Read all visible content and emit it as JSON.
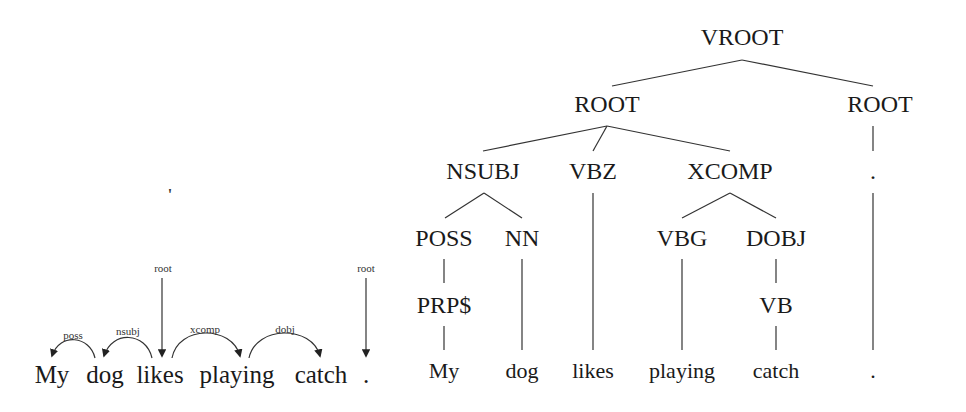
{
  "dependency_diagram": {
    "words": [
      {
        "text": "My",
        "x": 52
      },
      {
        "text": "dog",
        "x": 105
      },
      {
        "text": "likes",
        "x": 160
      },
      {
        "text": "playing",
        "x": 237
      },
      {
        "text": "catch",
        "x": 321
      },
      {
        "text": ".",
        "x": 366
      }
    ],
    "root_labels": [
      {
        "text": "root",
        "x": 163
      },
      {
        "text": "root",
        "x": 366
      }
    ],
    "arcs": [
      {
        "label": "poss",
        "from": "dog",
        "to": "My",
        "label_x": 73
      },
      {
        "label": "nsubj",
        "from": "likes",
        "to": "dog",
        "label_x": 128
      },
      {
        "label": "xcomp",
        "from": "likes",
        "to": "playing",
        "label_x": 205
      },
      {
        "label": "dobj",
        "from": "playing",
        "to": "catch",
        "label_x": 285
      }
    ],
    "stray_mark": "'"
  },
  "constituency_tree": {
    "nodes": {
      "vroot": {
        "label": "VROOT",
        "x": 742,
        "y": 37
      },
      "root1": {
        "label": "ROOT",
        "x": 607,
        "y": 103
      },
      "root2": {
        "label": "ROOT",
        "x": 873,
        "y": 103
      },
      "nsubj": {
        "label": "NSUBJ",
        "x": 483,
        "y": 170
      },
      "vbz": {
        "label": "VBZ",
        "x": 593,
        "y": 170
      },
      "xcomp": {
        "label": "XCOMP",
        "x": 730,
        "y": 170
      },
      "punct": {
        "label": ".",
        "x": 873,
        "y": 170
      },
      "poss": {
        "label": "POSS",
        "x": 444,
        "y": 238
      },
      "nn": {
        "label": "NN",
        "x": 522,
        "y": 238
      },
      "vbg": {
        "label": "VBG",
        "x": 682,
        "y": 238
      },
      "dobj": {
        "label": "DOBJ",
        "x": 776,
        "y": 238
      },
      "prp": {
        "label": "PRP$",
        "x": 444,
        "y": 305
      },
      "vb": {
        "label": "VB",
        "x": 776,
        "y": 305
      }
    },
    "leaves": [
      {
        "text": "My",
        "x": 444
      },
      {
        "text": "dog",
        "x": 522
      },
      {
        "text": "likes",
        "x": 593
      },
      {
        "text": "playing",
        "x": 682
      },
      {
        "text": "catch",
        "x": 776
      },
      {
        "text": ".",
        "x": 873
      }
    ]
  }
}
